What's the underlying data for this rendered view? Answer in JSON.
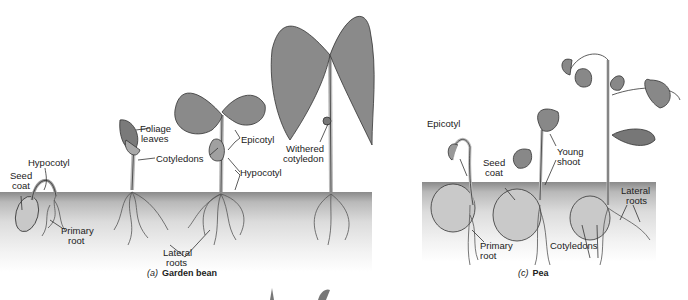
{
  "figure": {
    "panel_a": {
      "caption_letter": "(a)",
      "caption_title": "Garden bean",
      "labels": {
        "hypocotyl_1": "Hypocotyl",
        "seed_coat_1": "Seed",
        "seed_coat_2": "coat",
        "primary_root_1": "Primary",
        "primary_root_2": "root",
        "foliage_1": "Foliage",
        "foliage_2": "leaves",
        "cotyledons": "Cotyledons",
        "epicotyl": "Epicotyl",
        "hypocotyl_2": "Hypocotyl",
        "lateral_1": "Lateral",
        "lateral_2": "roots",
        "withered_1": "Withered",
        "withered_2": "cotyledon"
      }
    },
    "panel_c": {
      "caption_letter": "(c)",
      "caption_title": "Pea",
      "labels": {
        "epicotyl": "Epicotyl",
        "seed_coat_1": "Seed",
        "seed_coat_2": "coat",
        "young_shoot_1": "Young",
        "young_shoot_2": "shoot",
        "primary_root_1": "Primary",
        "primary_root_2": "root",
        "cotyledons": "Cotyledons",
        "lateral_1": "Lateral",
        "lateral_2": "roots"
      }
    },
    "colors": {
      "leaf": "#8c8c8c",
      "leaf_dark": "#5a5a5a",
      "stem": "#d8d8d8",
      "line": "#333333"
    }
  }
}
